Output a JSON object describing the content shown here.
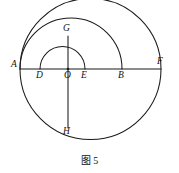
{
  "figure": {
    "caption": "图 5",
    "caption_position": {
      "x": 0,
      "y": 152
    },
    "canvas": {
      "width": 179,
      "height": 173
    },
    "stroke_color": "#1a1a1a",
    "background_color": "#ffffff",
    "points": [
      {
        "id": "A",
        "label": "A",
        "x": 20,
        "y": 69,
        "label_x": 11,
        "label_y": 60,
        "role": "left-end-of-diameter-AF"
      },
      {
        "id": "D",
        "label": "D",
        "x": 40,
        "y": 69,
        "label_x": 36,
        "label_y": 71,
        "role": "left-end-of-small-semicircle"
      },
      {
        "id": "O",
        "label": "O",
        "x": 68,
        "y": 69,
        "label_x": 64,
        "label_y": 71,
        "role": "center"
      },
      {
        "id": "E",
        "label": "E",
        "x": 85,
        "y": 69,
        "label_x": 81,
        "label_y": 71,
        "role": "right-end-of-small-semicircle"
      },
      {
        "id": "B",
        "label": "B",
        "x": 122,
        "y": 69,
        "label_x": 118,
        "label_y": 71,
        "role": "right-end-of-semicircle-AB"
      },
      {
        "id": "F",
        "label": "F",
        "x": 161,
        "y": 69,
        "label_x": 157,
        "label_y": 58,
        "role": "right-end-of-diameter-AF"
      },
      {
        "id": "G",
        "label": "G",
        "x": 68,
        "y": 36,
        "label_x": 63,
        "label_y": 25,
        "role": "top-of-vertical-chord"
      },
      {
        "id": "H",
        "label": "H",
        "x": 68,
        "y": 128,
        "label_x": 63,
        "label_y": 128,
        "role": "bottom-of-vertical-chord"
      }
    ],
    "segments": [
      {
        "id": "AF",
        "label": "AF",
        "from": "A",
        "to": "F",
        "x1": 20,
        "y1": 69,
        "x2": 161,
        "y2": 69
      },
      {
        "id": "GH",
        "label": "GH",
        "from": "G",
        "to": "H",
        "x1": 68,
        "y1": 36,
        "x2": 68,
        "y2": 128
      }
    ],
    "circles": [
      {
        "id": "circle-AF",
        "label": "circle on diameter AF",
        "type": "full-circle",
        "cx": 90.5,
        "cy": 69,
        "r": 70.5
      }
    ],
    "arcs": [
      {
        "id": "semicircle-AB",
        "label": "upper semicircle on diameter AB",
        "type": "upper-semicircle",
        "cx": 71,
        "cy": 69,
        "r": 51,
        "from_x": 20,
        "to_x": 122
      },
      {
        "id": "semicircle-DE",
        "label": "upper semicircle on diameter DE",
        "type": "upper-semicircle",
        "cx": 62.5,
        "cy": 69,
        "r": 22.5,
        "from_x": 40,
        "to_x": 85
      }
    ]
  }
}
